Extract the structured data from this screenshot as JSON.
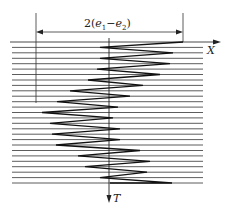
{
  "diagram": {
    "dimension_label": {
      "prefix": "2(",
      "e1": "e",
      "sub1": "1",
      "minus": "−",
      "e2": "e",
      "sub2": "2",
      "suffix": ")"
    },
    "x_axis_label": "X",
    "t_axis_label": "T",
    "line_count": 27,
    "colors": {
      "line": "#333333",
      "zigzag": "#111111",
      "background": "#ffffff"
    },
    "zigzag_vertices_x": [
      183,
      100,
      173,
      100,
      170,
      97,
      160,
      88,
      143,
      70,
      130,
      57,
      118,
      42,
      113,
      50,
      120,
      52,
      120,
      56,
      140,
      78,
      150,
      85,
      147,
      100,
      172,
      110
    ]
  }
}
